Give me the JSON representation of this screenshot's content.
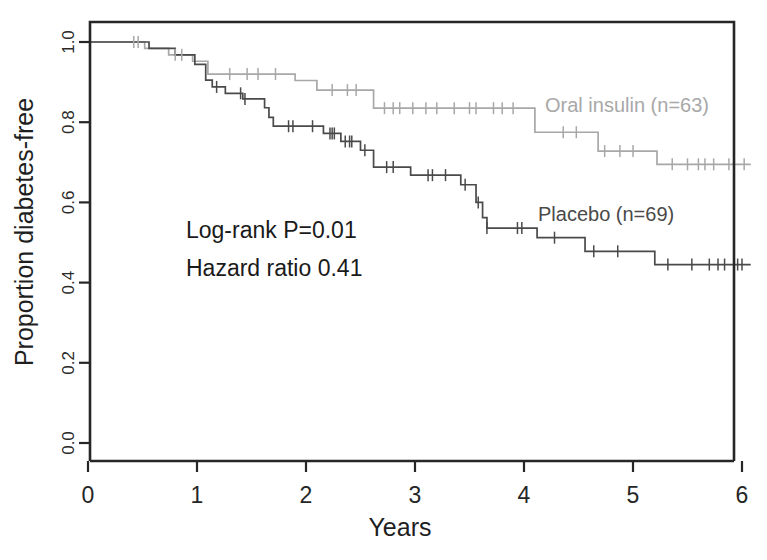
{
  "chart_data": {
    "type": "line",
    "subtype": "kaplan-meier-step",
    "title": "",
    "xlabel": "Years",
    "ylabel": "Proportion diabetes-free",
    "xlim": [
      0,
      6.1
    ],
    "ylim": [
      0,
      1.04
    ],
    "xticks": [
      0,
      1,
      2,
      3,
      4,
      5,
      6
    ],
    "xtick_labels": [
      "0",
      "1",
      "2",
      "3",
      "4",
      "5",
      "6"
    ],
    "yticks": [
      0.0,
      0.2,
      0.4,
      0.6,
      0.8,
      1.0
    ],
    "ytick_labels": [
      "0.0",
      "0.2",
      "0.4",
      "0.6",
      "0.8",
      "1.0"
    ],
    "grid": false,
    "legend_position": "inline-annotations",
    "annotations": [
      {
        "name": "log-rank",
        "text": "Log-rank P=0.01",
        "x": 1.05,
        "y": 0.5
      },
      {
        "name": "hazard-ratio",
        "text": "Hazard ratio 0.41",
        "x": 1.05,
        "y": 0.435
      }
    ],
    "series": [
      {
        "name": "Oral insulin (n=63)",
        "label": "Oral insulin (n=63)",
        "n": 63,
        "color": "#a8a8a8",
        "label_x": 4.18,
        "label_y": 0.828,
        "final_value": 0.695,
        "points": [
          [
            0.0,
            1.0
          ],
          [
            0.38,
            1.0
          ],
          [
            0.52,
            0.984
          ],
          [
            0.7,
            0.984
          ],
          [
            0.74,
            0.968
          ],
          [
            0.88,
            0.968
          ],
          [
            0.96,
            0.952
          ],
          [
            1.04,
            0.952
          ],
          [
            1.1,
            0.92
          ],
          [
            1.62,
            0.92
          ],
          [
            1.68,
            0.92
          ],
          [
            1.9,
            0.904
          ],
          [
            2.02,
            0.904
          ],
          [
            2.1,
            0.88
          ],
          [
            2.56,
            0.88
          ],
          [
            2.62,
            0.835
          ],
          [
            4.02,
            0.835
          ],
          [
            4.1,
            0.775
          ],
          [
            4.62,
            0.775
          ],
          [
            4.68,
            0.728
          ],
          [
            5.16,
            0.728
          ],
          [
            5.22,
            0.695
          ],
          [
            6.08,
            0.695
          ]
        ],
        "censor_marks": [
          [
            0.42,
            1.0
          ],
          [
            0.46,
            1.0
          ],
          [
            0.8,
            0.968
          ],
          [
            0.86,
            0.968
          ],
          [
            1.3,
            0.92
          ],
          [
            1.46,
            0.92
          ],
          [
            1.56,
            0.92
          ],
          [
            1.72,
            0.92
          ],
          [
            2.24,
            0.88
          ],
          [
            2.38,
            0.88
          ],
          [
            2.46,
            0.88
          ],
          [
            2.72,
            0.835
          ],
          [
            2.8,
            0.835
          ],
          [
            2.86,
            0.835
          ],
          [
            2.98,
            0.835
          ],
          [
            3.1,
            0.835
          ],
          [
            3.2,
            0.835
          ],
          [
            3.36,
            0.835
          ],
          [
            3.5,
            0.835
          ],
          [
            3.56,
            0.835
          ],
          [
            3.72,
            0.835
          ],
          [
            3.8,
            0.835
          ],
          [
            3.9,
            0.835
          ],
          [
            4.36,
            0.775
          ],
          [
            4.48,
            0.775
          ],
          [
            4.74,
            0.728
          ],
          [
            4.88,
            0.728
          ],
          [
            5.0,
            0.728
          ],
          [
            5.36,
            0.695
          ],
          [
            5.5,
            0.695
          ],
          [
            5.6,
            0.695
          ],
          [
            5.66,
            0.695
          ],
          [
            5.74,
            0.695
          ],
          [
            5.88,
            0.695
          ],
          [
            6.02,
            0.695
          ]
        ]
      },
      {
        "name": "Placebo (n=69)",
        "label": "Placebo (n=69)",
        "n": 69,
        "color": "#4a4a4a",
        "label_x": 3.7,
        "label_y": 0.578,
        "final_value": 0.445,
        "points": [
          [
            0.0,
            1.0
          ],
          [
            0.5,
            1.0
          ],
          [
            0.56,
            0.984
          ],
          [
            0.74,
            0.984
          ],
          [
            0.8,
            0.968
          ],
          [
            0.92,
            0.968
          ],
          [
            0.98,
            0.944
          ],
          [
            1.04,
            0.944
          ],
          [
            1.08,
            0.905
          ],
          [
            1.14,
            0.888
          ],
          [
            1.22,
            0.888
          ],
          [
            1.26,
            0.872
          ],
          [
            1.36,
            0.872
          ],
          [
            1.42,
            0.858
          ],
          [
            1.58,
            0.858
          ],
          [
            1.62,
            0.836
          ],
          [
            1.66,
            0.812
          ],
          [
            1.7,
            0.79
          ],
          [
            1.94,
            0.79
          ],
          [
            2.0,
            0.79
          ],
          [
            2.16,
            0.772
          ],
          [
            2.28,
            0.772
          ],
          [
            2.32,
            0.752
          ],
          [
            2.44,
            0.752
          ],
          [
            2.5,
            0.73
          ],
          [
            2.58,
            0.73
          ],
          [
            2.62,
            0.688
          ],
          [
            2.9,
            0.688
          ],
          [
            2.96,
            0.668
          ],
          [
            3.36,
            0.668
          ],
          [
            3.42,
            0.644
          ],
          [
            3.52,
            0.644
          ],
          [
            3.56,
            0.6
          ],
          [
            3.62,
            0.562
          ],
          [
            3.66,
            0.536
          ],
          [
            4.06,
            0.536
          ],
          [
            4.12,
            0.512
          ],
          [
            4.5,
            0.512
          ],
          [
            4.56,
            0.478
          ],
          [
            5.14,
            0.478
          ],
          [
            5.2,
            0.445
          ],
          [
            6.08,
            0.445
          ]
        ],
        "censor_marks": [
          [
            1.18,
            0.888
          ],
          [
            1.4,
            0.872
          ],
          [
            1.44,
            0.858
          ],
          [
            1.84,
            0.79
          ],
          [
            1.88,
            0.79
          ],
          [
            2.06,
            0.79
          ],
          [
            2.22,
            0.772
          ],
          [
            2.24,
            0.772
          ],
          [
            2.26,
            0.772
          ],
          [
            2.36,
            0.752
          ],
          [
            2.4,
            0.752
          ],
          [
            2.42,
            0.752
          ],
          [
            2.54,
            0.73
          ],
          [
            2.74,
            0.688
          ],
          [
            2.8,
            0.688
          ],
          [
            3.12,
            0.668
          ],
          [
            3.16,
            0.668
          ],
          [
            3.28,
            0.668
          ],
          [
            3.46,
            0.644
          ],
          [
            3.58,
            0.6
          ],
          [
            3.66,
            0.536
          ],
          [
            3.94,
            0.536
          ],
          [
            3.98,
            0.536
          ],
          [
            4.28,
            0.512
          ],
          [
            4.64,
            0.478
          ],
          [
            4.86,
            0.478
          ],
          [
            5.32,
            0.445
          ],
          [
            5.54,
            0.445
          ],
          [
            5.7,
            0.445
          ],
          [
            5.78,
            0.445
          ],
          [
            5.84,
            0.445
          ],
          [
            5.96,
            0.445
          ],
          [
            6.0,
            0.445
          ]
        ]
      }
    ]
  },
  "figure": {
    "plot_area": {
      "left": 90,
      "top": 22,
      "right": 734,
      "bottom": 461
    },
    "x_axis_pixels": {
      "x0": 88,
      "x6": 742
    },
    "y_axis_pixels": {
      "y_1_0": 42,
      "y_0_0": 443
    },
    "background_color": "#ffffff",
    "frame_color": "#262626"
  }
}
